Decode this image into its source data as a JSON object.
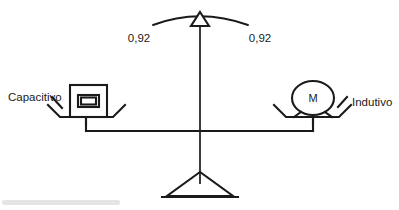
{
  "diagram": {
    "type": "balance-scale",
    "ink_color": "#1a1a1a",
    "background_color": "#ffffff",
    "pointer": {
      "icon": "triangle-pointer-icon",
      "arc_label": "arc-scale"
    },
    "readings": [
      {
        "id": "left",
        "value": "0,92"
      },
      {
        "id": "right",
        "value": "0,92"
      }
    ],
    "left_side": {
      "label": "Capacitivo",
      "load_icon": "capacitor-box-icon",
      "pan_icon": "scale-pan-icon"
    },
    "right_side": {
      "label": "Indutivo",
      "load_icon": "motor-icon",
      "motor_symbol": "M",
      "pan_icon": "scale-pan-icon"
    },
    "base": {
      "fulcrum_icon": "triangle-fulcrum-icon",
      "post_icon": "vertical-post-icon",
      "beam_icon": "balance-beam-icon"
    }
  }
}
